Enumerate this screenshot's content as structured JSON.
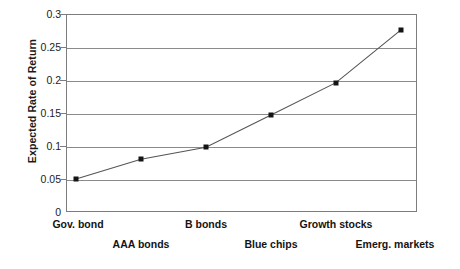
{
  "chart_data": {
    "type": "line",
    "title": "",
    "xlabel": "",
    "ylabel": "Expected Rate of Return",
    "categories": [
      "Gov. bond",
      "AAA bonds",
      "B bonds",
      "Blue chips",
      "Growth stocks",
      "Emerg. markets"
    ],
    "values": [
      0.05,
      0.08,
      0.098,
      0.147,
      0.196,
      0.276
    ],
    "series": [
      {
        "name": "Expected Rate of Return",
        "values": [
          0.05,
          0.08,
          0.098,
          0.147,
          0.196,
          0.276
        ]
      }
    ],
    "ylim": [
      0,
      0.3
    ],
    "yticks": [
      "0",
      "0.05",
      "0.1",
      "0.15",
      "0.2",
      "0.25",
      "0.3"
    ],
    "ytick_values": [
      0,
      0.05,
      0.1,
      0.15,
      0.2,
      0.25,
      0.3
    ],
    "grid": "horizontal",
    "legend": "none",
    "marker": "square",
    "colors": {
      "line": "#555555",
      "marker": "#141414",
      "grid": "#8a8a8a",
      "axis": "#7d7d7d",
      "text": "#141414",
      "background": "#ffffff"
    }
  },
  "axis": {
    "y_title": "Expected Rate of Return",
    "y_ticks": [
      {
        "label": "0.3",
        "value": 0.3
      },
      {
        "label": "0.25",
        "value": 0.25
      },
      {
        "label": "0.2",
        "value": 0.2
      },
      {
        "label": "0.15",
        "value": 0.15
      },
      {
        "label": "0.1",
        "value": 0.1
      },
      {
        "label": "0.05",
        "value": 0.05
      },
      {
        "label": "0",
        "value": 0
      }
    ],
    "x_labels": [
      {
        "label": "Gov. bond",
        "row": "top"
      },
      {
        "label": "AAA bonds",
        "row": "bottom"
      },
      {
        "label": "B bonds",
        "row": "top"
      },
      {
        "label": "Blue chips",
        "row": "bottom"
      },
      {
        "label": "Growth stocks",
        "row": "top"
      },
      {
        "label": "Emerg. markets",
        "row": "bottom"
      }
    ]
  }
}
